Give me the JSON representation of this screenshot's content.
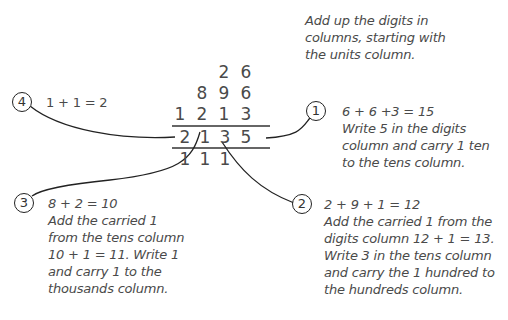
{
  "intro": {
    "lines": [
      "Add up the digits in",
      "columns, starting with",
      "the units column."
    ]
  },
  "sum": {
    "addends": [
      [
        "",
        "",
        "2",
        "6"
      ],
      [
        "",
        "8",
        "9",
        "6"
      ],
      [
        "1",
        "2",
        "1",
        "3"
      ]
    ],
    "result": [
      "2",
      "1",
      "3",
      "5"
    ],
    "carries": [
      "1",
      "1",
      "1",
      ""
    ]
  },
  "steps": [
    {
      "number": "1",
      "equation": "6 + 6 +3 = 15",
      "lines": [
        "Write 5 in the digits",
        "column and carry 1 ten",
        "to the tens column."
      ]
    },
    {
      "number": "2",
      "equation": "2 + 9 + 1 = 12",
      "lines": [
        "Add the carried 1 from the",
        "digits column 12 + 1 = 13.",
        "Write 3 in the tens column",
        "and carry the 1 hundred to",
        "the hundreds column."
      ]
    },
    {
      "number": "3",
      "equation": "8 + 2 = 10",
      "lines": [
        "Add the carried 1",
        "from the tens column",
        "10 + 1 = 11. Write 1",
        "and carry 1 to the",
        "thousands column."
      ]
    },
    {
      "number": "4",
      "equation": "1 + 1 = 2",
      "lines": []
    }
  ]
}
